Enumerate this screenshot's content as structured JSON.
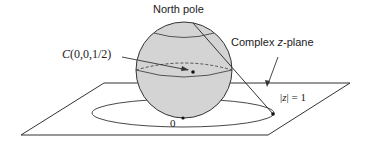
{
  "diagram": {
    "labels": {
      "north_pole": "North pole",
      "center": "C(0,0,1/2)",
      "center_letter": "C",
      "center_coords": "(0,0,1/2)",
      "plane": "Complex z-plane",
      "plane_prefix": "Complex ",
      "plane_var": "z",
      "plane_suffix": "-plane",
      "unit_circle": "|z| = 1",
      "unit_circle_open": "|",
      "unit_circle_var": "z",
      "unit_circle_close": "| = 1",
      "origin": "0"
    },
    "colors": {
      "sphere_fill": "#d4d4d4",
      "stroke": "#333333",
      "background": "#ffffff"
    }
  }
}
